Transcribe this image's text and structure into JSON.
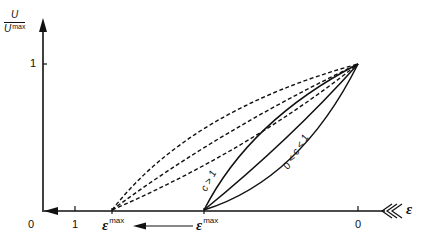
{
  "diagram": {
    "y_axis": {
      "label_numerator": "U",
      "label_denominator": "U",
      "label_denominator_sup": "max",
      "tick_label": "1"
    },
    "x_axis": {
      "label": "ε",
      "tick_labels": {
        "origin": "0",
        "one": "1",
        "right_zero": "0"
      }
    },
    "eps_max_labels": {
      "left": {
        "symbol": "ε",
        "sup": "max"
      },
      "right": {
        "symbol": "ε",
        "sup": "max"
      }
    },
    "curve_labels": {
      "c_gt_1": "c > 1",
      "c_between": "0 < c < 1"
    },
    "colors": {
      "ink": "#111111",
      "background": "#ffffff"
    }
  }
}
